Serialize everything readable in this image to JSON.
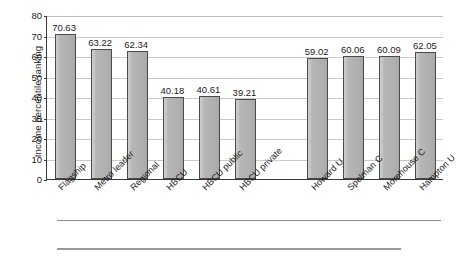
{
  "chart_data": {
    "type": "bar",
    "title": "",
    "subtitle": "",
    "xlabel": "",
    "ylabel": "Income percentile ranking",
    "ylim": [
      0,
      80
    ],
    "yticks": [
      0,
      10,
      20,
      30,
      40,
      50,
      60,
      70,
      80
    ],
    "grid": true,
    "legend": "none",
    "orientation": "vertical",
    "bar_color": "#b3b3b3",
    "bar_edge_color": "#4a4a4a",
    "categories": [
      "Flagship",
      "Metro leader",
      "Regional",
      "HBCU",
      "HBCU public",
      "HBCU private",
      "Howard U",
      "Spelman C",
      "Morehouse C",
      "Hampton U"
    ],
    "values": [
      70.63,
      63.22,
      62.34,
      40.18,
      40.61,
      39.21,
      59.02,
      60.06,
      60.09,
      62.05
    ],
    "value_labels": [
      "70.63",
      "63.22",
      "62.34",
      "40.18",
      "40.61",
      "39.21",
      "59.02",
      "60.06",
      "60.09",
      "62.05"
    ],
    "groups": [
      {
        "name": "institution-types",
        "categories": [
          "Flagship",
          "Metro leader",
          "Regional",
          "HBCU",
          "HBCU public",
          "HBCU private"
        ]
      },
      {
        "name": "named-hbcus",
        "categories": [
          "Howard U",
          "Spelman C",
          "Morehouse C",
          "Hampton U"
        ]
      }
    ],
    "group_gap_after_index": 5
  }
}
